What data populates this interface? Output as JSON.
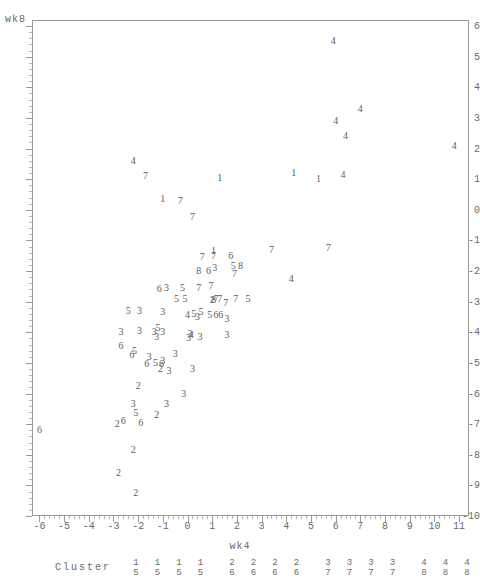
{
  "axes": {
    "y_title": "wk8",
    "x_title": "wk4",
    "y_ticks": [
      "6",
      "5",
      "4",
      "3",
      "2",
      "1",
      "0",
      "-1",
      "-2",
      "-3",
      "-4",
      "-5",
      "-6",
      "-7",
      "-8",
      "-9",
      "-10"
    ],
    "x_ticks": [
      "-6",
      "-5",
      "-4",
      "-3",
      "-2",
      "-1",
      "0",
      "1",
      "2",
      "3",
      "4",
      "5",
      "6",
      "7",
      "8",
      "9",
      "10",
      "11"
    ]
  },
  "legend": {
    "title": "Cluster",
    "pairs": [
      {
        "top": "1",
        "bottom": "5"
      },
      {
        "top": "1",
        "bottom": "5"
      },
      {
        "top": "1",
        "bottom": "5"
      },
      {
        "top": "1",
        "bottom": "5"
      },
      {
        "top": "2",
        "bottom": "6"
      },
      {
        "top": "2",
        "bottom": "6"
      },
      {
        "top": "2",
        "bottom": "6"
      },
      {
        "top": "2",
        "bottom": "6"
      },
      {
        "top": "3",
        "bottom": "7"
      },
      {
        "top": "3",
        "bottom": "7"
      },
      {
        "top": "3",
        "bottom": "7"
      },
      {
        "top": "3",
        "bottom": "7"
      },
      {
        "top": "4",
        "bottom": "8"
      },
      {
        "top": "4",
        "bottom": "8"
      },
      {
        "top": "4",
        "bottom": "8"
      },
      {
        "top": "4",
        "bottom": "8"
      }
    ]
  },
  "chart_data": {
    "type": "scatter",
    "title": "",
    "xlabel": "wk4",
    "ylabel": "wk8",
    "xlim": [
      -6.3,
      11.4
    ],
    "ylim": [
      -10.0,
      6.2
    ],
    "grid": false,
    "legend_position": "bottom",
    "marker_encoding": "cluster-number-glyph",
    "series_note": "Each plotted glyph is the cluster id (1-8) of the observation.",
    "points": [
      {
        "label": "4",
        "x": 5.9,
        "y": 5.5
      },
      {
        "label": "4",
        "x": 7.0,
        "y": 3.3
      },
      {
        "label": "4",
        "x": 6.0,
        "y": 2.9
      },
      {
        "label": "4",
        "x": 6.4,
        "y": 2.4
      },
      {
        "label": "4",
        "x": 10.8,
        "y": 2.1
      },
      {
        "label": "4",
        "x": -2.2,
        "y": 1.6
      },
      {
        "label": "7",
        "x": -1.7,
        "y": 1.1
      },
      {
        "label": "1",
        "x": 4.3,
        "y": 1.2
      },
      {
        "label": "1",
        "x": 5.3,
        "y": 1.0
      },
      {
        "label": "4",
        "x": 6.3,
        "y": 1.15
      },
      {
        "label": "1",
        "x": 1.3,
        "y": 1.05
      },
      {
        "label": "1",
        "x": -1.0,
        "y": 0.35
      },
      {
        "label": "7",
        "x": -0.3,
        "y": 0.3
      },
      {
        "label": "7",
        "x": 0.2,
        "y": -0.25
      },
      {
        "label": "7",
        "x": 5.7,
        "y": -1.25
      },
      {
        "label": "7",
        "x": 3.4,
        "y": -1.3
      },
      {
        "label": "1",
        "x": 1.05,
        "y": -1.35
      },
      {
        "label": "7",
        "x": 0.6,
        "y": -1.55
      },
      {
        "label": "7",
        "x": 1.05,
        "y": -1.5
      },
      {
        "label": "6",
        "x": 1.75,
        "y": -1.5
      },
      {
        "label": "5",
        "x": 1.85,
        "y": -1.85
      },
      {
        "label": "8",
        "x": 2.15,
        "y": -1.85
      },
      {
        "label": "8",
        "x": 0.45,
        "y": -2.0
      },
      {
        "label": "6",
        "x": 0.85,
        "y": -2.0
      },
      {
        "label": "3",
        "x": 1.1,
        "y": -1.9
      },
      {
        "label": "7",
        "x": 1.9,
        "y": -2.1
      },
      {
        "label": "4",
        "x": 4.2,
        "y": -2.25
      },
      {
        "label": "6",
        "x": -1.15,
        "y": -2.6
      },
      {
        "label": "3",
        "x": -0.85,
        "y": -2.55
      },
      {
        "label": "5",
        "x": -0.2,
        "y": -2.55
      },
      {
        "label": "7",
        "x": 0.45,
        "y": -2.55
      },
      {
        "label": "7",
        "x": 0.95,
        "y": -2.5
      },
      {
        "label": "5",
        "x": -0.45,
        "y": -2.9
      },
      {
        "label": "5",
        "x": -0.1,
        "y": -2.9
      },
      {
        "label": "8",
        "x": 1.05,
        "y": -2.95
      },
      {
        "label": "7",
        "x": 1.15,
        "y": -2.9
      },
      {
        "label": "2",
        "x": 1.0,
        "y": -2.95
      },
      {
        "label": "7",
        "x": 1.3,
        "y": -2.9
      },
      {
        "label": "7",
        "x": 1.55,
        "y": -3.05
      },
      {
        "label": "7",
        "x": 1.95,
        "y": -2.9
      },
      {
        "label": "5",
        "x": 2.45,
        "y": -2.9
      },
      {
        "label": "5",
        "x": -2.4,
        "y": -3.3
      },
      {
        "label": "3",
        "x": -1.95,
        "y": -3.3
      },
      {
        "label": "3",
        "x": -1.0,
        "y": -3.35
      },
      {
        "label": "4",
        "x": 0.0,
        "y": -3.45
      },
      {
        "label": "5",
        "x": 0.25,
        "y": -3.4
      },
      {
        "label": "5",
        "x": 0.55,
        "y": -3.35
      },
      {
        "label": "3",
        "x": 0.4,
        "y": -3.5
      },
      {
        "label": "5",
        "x": 0.9,
        "y": -3.45
      },
      {
        "label": "6",
        "x": 1.15,
        "y": -3.45
      },
      {
        "label": "6",
        "x": 1.35,
        "y": -3.45
      },
      {
        "label": "3",
        "x": 1.6,
        "y": -3.55
      },
      {
        "label": "3",
        "x": -2.7,
        "y": -4.0
      },
      {
        "label": "3",
        "x": -1.95,
        "y": -3.95
      },
      {
        "label": "3",
        "x": -1.35,
        "y": -4.0
      },
      {
        "label": "5",
        "x": -1.2,
        "y": -3.85
      },
      {
        "label": "3",
        "x": -1.25,
        "y": -4.15
      },
      {
        "label": "3",
        "x": -1.0,
        "y": -4.0
      },
      {
        "label": "3",
        "x": 0.1,
        "y": -4.05
      },
      {
        "label": "4",
        "x": 0.15,
        "y": -4.1
      },
      {
        "label": "3",
        "x": 0.05,
        "y": -4.2
      },
      {
        "label": "3",
        "x": 0.5,
        "y": -4.15
      },
      {
        "label": "3",
        "x": 1.6,
        "y": -4.1
      },
      {
        "label": "6",
        "x": -2.7,
        "y": -4.45
      },
      {
        "label": "5",
        "x": -2.15,
        "y": -4.6
      },
      {
        "label": "6",
        "x": -2.25,
        "y": -4.75
      },
      {
        "label": "3",
        "x": -1.55,
        "y": -4.8
      },
      {
        "label": "3",
        "x": -0.5,
        "y": -4.7
      },
      {
        "label": "6",
        "x": -1.65,
        "y": -5.05
      },
      {
        "label": "5",
        "x": -1.3,
        "y": -5.0
      },
      {
        "label": "6",
        "x": -1.05,
        "y": -5.05
      },
      {
        "label": "3",
        "x": -1.0,
        "y": -4.95
      },
      {
        "label": "2",
        "x": -1.1,
        "y": -5.2
      },
      {
        "label": "3",
        "x": -0.75,
        "y": -5.25
      },
      {
        "label": "3",
        "x": 0.2,
        "y": -5.2
      },
      {
        "label": "2",
        "x": -2.0,
        "y": -5.75
      },
      {
        "label": "3",
        "x": -0.15,
        "y": -6.0
      },
      {
        "label": "3",
        "x": -2.2,
        "y": -6.35
      },
      {
        "label": "3",
        "x": -0.85,
        "y": -6.35
      },
      {
        "label": "5",
        "x": -2.1,
        "y": -6.65
      },
      {
        "label": "2",
        "x": -1.25,
        "y": -6.7
      },
      {
        "label": "2",
        "x": -2.85,
        "y": -7.0
      },
      {
        "label": "6",
        "x": -2.6,
        "y": -6.9
      },
      {
        "label": "6",
        "x": -1.9,
        "y": -6.95
      },
      {
        "label": "6",
        "x": -6.0,
        "y": -7.2
      },
      {
        "label": "2",
        "x": -2.2,
        "y": -7.85
      },
      {
        "label": "2",
        "x": -2.8,
        "y": -8.6
      },
      {
        "label": "2",
        "x": -2.1,
        "y": -9.25
      }
    ]
  }
}
